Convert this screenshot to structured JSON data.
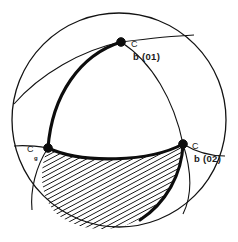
{
  "figure": {
    "type": "stereographic-projection",
    "title": "",
    "background_color": "#ffffff",
    "line_color": "#121212",
    "hatch_color": "#111111",
    "outer_circle": {
      "center_x": 119,
      "center_y": 120,
      "radius": 107,
      "stroke_width": 1.2
    },
    "nodes": [
      {
        "id": "node-top",
        "x": 121,
        "y": 42,
        "radius": 4.2,
        "label": "b (01)",
        "marker_label": "C",
        "marker_subscript": ""
      },
      {
        "id": "node-left",
        "x": 48,
        "y": 148,
        "radius": 4.2,
        "label": "",
        "marker_label": "C",
        "marker_subscript": "g"
      },
      {
        "id": "node-right",
        "x": 183,
        "y": 144,
        "radius": 4.2,
        "label": "b (02)",
        "marker_label": "C",
        "marker_subscript": ""
      }
    ],
    "labels": {
      "top_c": "C",
      "top_main": "b (01)",
      "left_c": "C",
      "left_sub": "g",
      "right_c": "C",
      "right_main": "b (02)"
    },
    "hatching": {
      "angle_deg": 62,
      "spacing_px": 4.3,
      "stroke_width": 1.5,
      "region": "bottom-lune"
    }
  }
}
